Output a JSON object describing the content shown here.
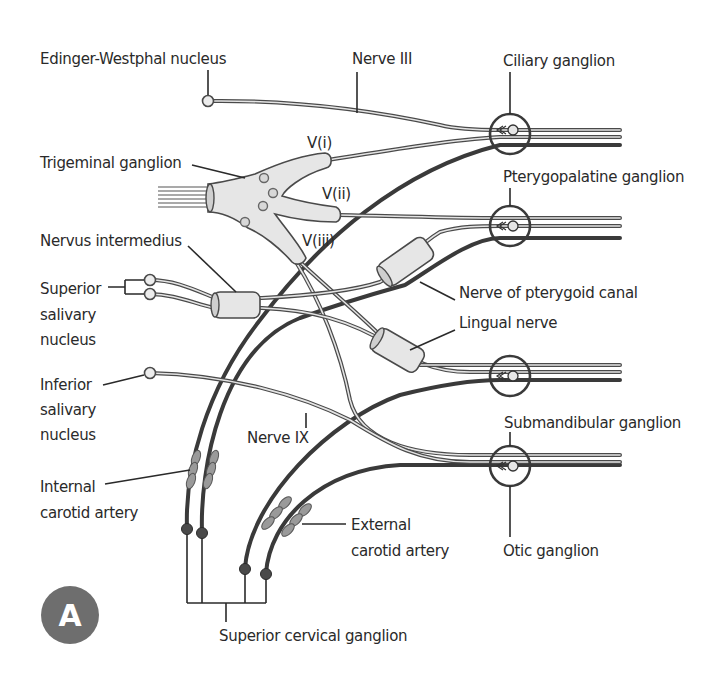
{
  "figure": {
    "panel_badge": "A",
    "colors": {
      "line": "#4a4a4a",
      "sheath_fill": "#e6e6e6",
      "badge_fill": "#6e6e6e",
      "text": "#2a2a2a"
    }
  },
  "labels": {
    "edinger_westphal": "Edinger-Westphal nucleus",
    "nerve_iii": "Nerve III",
    "ciliary_ganglion": "Ciliary ganglion",
    "v_i": "V(i)",
    "trigeminal_ganglion": "Trigeminal ganglion",
    "v_ii": "V(ii)",
    "pterygopalatine_ganglion": "Pterygopalatine ganglion",
    "v_iii": "V(iii)",
    "nervus_intermedius": "Nervus intermedius",
    "superior_salivary_1": "Superior",
    "superior_salivary_2": "salivary",
    "superior_salivary_3": "nucleus",
    "nerve_pterygoid_canal": "Nerve of pterygoid canal",
    "lingual_nerve": "Lingual nerve",
    "inferior_salivary_1": "Inferior",
    "inferior_salivary_2": "salivary",
    "inferior_salivary_3": "nucleus",
    "nerve_ix": "Nerve IX",
    "submandibular_ganglion": "Submandibular ganglion",
    "internal_carotid_1": "Internal",
    "internal_carotid_2": "carotid artery",
    "external_carotid_1": "External",
    "external_carotid_2": "carotid artery",
    "otic_ganglion": "Otic ganglion",
    "superior_cervical_ganglion": "Superior cervical ganglion"
  }
}
